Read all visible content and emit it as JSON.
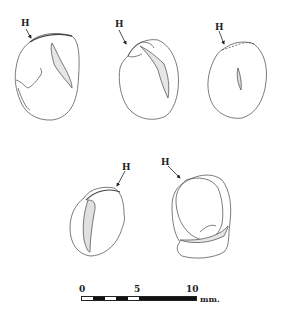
{
  "figure": {
    "specimens": [
      {
        "id": 1,
        "label": "H",
        "position": "top-left"
      },
      {
        "id": 2,
        "label": "H",
        "position": "top-center"
      },
      {
        "id": 3,
        "label": "H",
        "position": "top-right"
      },
      {
        "id": 4,
        "label": "H",
        "position": "bottom-left"
      },
      {
        "id": 5,
        "label": "H",
        "position": "bottom-right"
      }
    ],
    "scale": {
      "ticks": [
        "0",
        "5",
        "10"
      ],
      "unit": "mm."
    },
    "colors": {
      "ink": "#222222",
      "background": "#ffffff"
    }
  }
}
